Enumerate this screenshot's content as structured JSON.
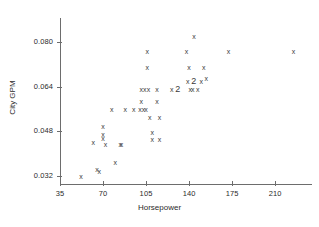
{
  "chart_data": {
    "type": "scatter",
    "title": "",
    "xlabel": "Horsepower",
    "ylabel": "City GPM",
    "xlim": [
      35,
      227
    ],
    "ylim": [
      0.0305,
      0.0855
    ],
    "xticks": [
      35,
      70,
      105,
      140,
      175,
      210
    ],
    "xticklabels": [
      "35",
      "70",
      "105",
      "140",
      "175",
      "210"
    ],
    "yticks": [
      0.032,
      0.048,
      0.064,
      0.08
    ],
    "yticklabels": [
      "0.032",
      "0.048",
      "0.064",
      "0.080"
    ],
    "grid": false,
    "legend": null,
    "marker": "x",
    "marker_color": "#3a3a3a",
    "axis_color": "#6d6d6d",
    "points": [
      {
        "x": 52,
        "y": 0.032,
        "n": 1
      },
      {
        "x": 62,
        "y": 0.044,
        "n": 1
      },
      {
        "x": 65,
        "y": 0.0345,
        "n": 1
      },
      {
        "x": 67,
        "y": 0.0338,
        "n": 1
      },
      {
        "x": 70,
        "y": 0.0498,
        "n": 1
      },
      {
        "x": 70,
        "y": 0.047,
        "n": 1
      },
      {
        "x": 70,
        "y": 0.0455,
        "n": 1
      },
      {
        "x": 72,
        "y": 0.0435,
        "n": 1
      },
      {
        "x": 77,
        "y": 0.0562,
        "n": 1
      },
      {
        "x": 80,
        "y": 0.0368,
        "n": 1
      },
      {
        "x": 84,
        "y": 0.0435,
        "n": 1
      },
      {
        "x": 85,
        "y": 0.0435,
        "n": 1
      },
      {
        "x": 88,
        "y": 0.0562,
        "n": 1
      },
      {
        "x": 95,
        "y": 0.0562,
        "n": 1
      },
      {
        "x": 100,
        "y": 0.0562,
        "n": 1
      },
      {
        "x": 101,
        "y": 0.0588,
        "n": 1
      },
      {
        "x": 103,
        "y": 0.0562,
        "n": 1
      },
      {
        "x": 105,
        "y": 0.0562,
        "n": 1
      },
      {
        "x": 101,
        "y": 0.0632,
        "n": 1
      },
      {
        "x": 104,
        "y": 0.0632,
        "n": 1
      },
      {
        "x": 107,
        "y": 0.0632,
        "n": 1
      },
      {
        "x": 106,
        "y": 0.077,
        "n": 1
      },
      {
        "x": 106,
        "y": 0.0712,
        "n": 1
      },
      {
        "x": 108,
        "y": 0.053,
        "n": 1
      },
      {
        "x": 110,
        "y": 0.0478,
        "n": 1
      },
      {
        "x": 110,
        "y": 0.0452,
        "n": 1
      },
      {
        "x": 116,
        "y": 0.0452,
        "n": 1
      },
      {
        "x": 116,
        "y": 0.053,
        "n": 1
      },
      {
        "x": 114,
        "y": 0.0588,
        "n": 1
      },
      {
        "x": 114,
        "y": 0.0632,
        "n": 1
      },
      {
        "x": 126,
        "y": 0.0632,
        "n": 2
      },
      {
        "x": 138,
        "y": 0.077,
        "n": 1
      },
      {
        "x": 140,
        "y": 0.0712,
        "n": 1
      },
      {
        "x": 139,
        "y": 0.066,
        "n": 2
      },
      {
        "x": 141,
        "y": 0.0632,
        "n": 1
      },
      {
        "x": 143,
        "y": 0.0632,
        "n": 1
      },
      {
        "x": 144,
        "y": 0.0823,
        "n": 1
      },
      {
        "x": 150,
        "y": 0.066,
        "n": 1
      },
      {
        "x": 152,
        "y": 0.0712,
        "n": 1
      },
      {
        "x": 154,
        "y": 0.067,
        "n": 1
      },
      {
        "x": 147,
        "y": 0.0632,
        "n": 1
      },
      {
        "x": 172,
        "y": 0.077,
        "n": 1
      },
      {
        "x": 225,
        "y": 0.077,
        "n": 1
      }
    ]
  },
  "axes": {
    "x_title": "Horsepower",
    "y_title": "City GPM"
  }
}
